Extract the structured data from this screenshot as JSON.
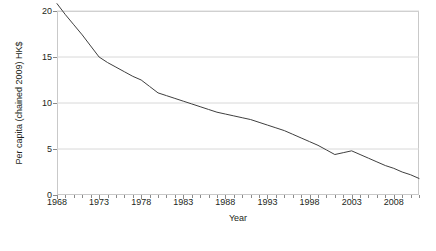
{
  "chart_data": {
    "type": "line",
    "title": "",
    "xlabel": "Year",
    "ylabel": "Per capita (chained 2009) HK$",
    "xlim": [
      1968,
      2011
    ],
    "ylim": [
      0,
      20
    ],
    "grid": true,
    "legend": null,
    "x_ticks": [
      1968,
      1973,
      1978,
      1983,
      1988,
      1993,
      1998,
      2003,
      2008
    ],
    "x_tick_labels": [
      "1968",
      "1973",
      "1978",
      "1983",
      "1988",
      "1993",
      "1998",
      "2003",
      "2008"
    ],
    "y_ticks": [
      0,
      5,
      10,
      15,
      20
    ],
    "y_tick_labels": [
      "0",
      "5",
      "10",
      "15",
      "20"
    ],
    "minor_x_tick_step": 1,
    "line_color": "#3f3f3f",
    "line_width": 1,
    "x": [
      1968,
      1969,
      1970,
      1971,
      1972,
      1973,
      1974,
      1975,
      1976,
      1977,
      1978,
      1979,
      1980,
      1981,
      1982,
      1983,
      1984,
      1985,
      1986,
      1987,
      1988,
      1989,
      1990,
      1991,
      1992,
      1993,
      1994,
      1995,
      1996,
      1997,
      1998,
      1999,
      2000,
      2001,
      2002,
      2003,
      2004,
      2005,
      2006,
      2007,
      2008,
      2009,
      2010,
      2011
    ],
    "values": [
      20.8,
      19.6,
      18.5,
      17.4,
      16.2,
      15.0,
      14.4,
      13.9,
      13.4,
      12.9,
      12.5,
      11.8,
      11.1,
      10.8,
      10.5,
      10.2,
      9.9,
      9.6,
      9.3,
      9.0,
      8.8,
      8.6,
      8.4,
      8.2,
      7.9,
      7.6,
      7.3,
      7.0,
      6.6,
      6.2,
      5.8,
      5.4,
      4.9,
      4.4,
      4.6,
      4.8,
      4.4,
      4.0,
      3.6,
      3.2,
      2.9,
      2.5,
      2.2,
      1.8
    ]
  }
}
